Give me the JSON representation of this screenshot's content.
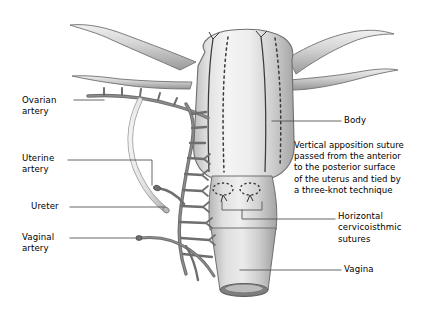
{
  "figure": {
    "background_color": "#ffffff"
  },
  "colors": {
    "organ_light": "#f2f2f2",
    "organ_mid": "#d8d8d8",
    "organ_shadow": "#a8a8a8",
    "organ_outline": "#6f6f6f",
    "vessel_dark": "#777777",
    "vessel_outline": "#5a5a5a",
    "ureter_light": "#cfcfcf",
    "suture_line": "#3a3a3a",
    "leader_line": "#555555",
    "text": "#000000"
  },
  "labels": {
    "left": [
      {
        "id": "ovarian-artery",
        "text": "Ovarian\nartery",
        "x": 22,
        "y": 95
      },
      {
        "id": "uterine-artery",
        "text": "Uterine\nartery",
        "x": 22,
        "y": 153
      },
      {
        "id": "ureter",
        "text": "Ureter",
        "x": 31,
        "y": 202
      },
      {
        "id": "vaginal-artery",
        "text": "Vaginal\nartery",
        "x": 22,
        "y": 233
      }
    ],
    "right": [
      {
        "id": "body",
        "text": "Body",
        "x": 344,
        "y": 116
      },
      {
        "id": "horizontal-cervicoisthmic-sutures",
        "text": "Horizontal\ncervicoisthmic\nsutures",
        "x": 338,
        "y": 211
      },
      {
        "id": "vagina",
        "text": "Vagina",
        "x": 344,
        "y": 266
      }
    ],
    "paragraph": {
      "id": "vertical-apposition-suture-note",
      "text": "Vertical apposition suture\npassed from the anterior\nto the posterior surface\nof the uterus and tied by\na three-knot technique",
      "x": 294,
      "y": 140
    }
  },
  "anatomy": {
    "parts": [
      {
        "name": "fallopian-tube-left",
        "description": "curved tube extending to upper left from the left uterine horn"
      },
      {
        "name": "round-ligament-left",
        "description": "lower curved tube on the left horn"
      },
      {
        "name": "fallopian-tube-right",
        "description": "curved tube extending to upper right from the right uterine horn"
      },
      {
        "name": "round-ligament-right",
        "description": "lower curved tube on the right horn"
      },
      {
        "name": "uterine-fundus-body",
        "description": "large rounded uterine body with vertical shading"
      },
      {
        "name": "cervix",
        "description": "narrowed isthmus below the uterine body"
      },
      {
        "name": "vagina-cuff",
        "description": "cylindrical vaginal cuff with open elliptical rim at the bottom"
      },
      {
        "name": "ovarian-artery-vessel",
        "description": "dark horizontal vessel with short superior branches at upper left"
      },
      {
        "name": "uterine-artery-arcade",
        "description": "dark vessel arcade running vertically along the left uterine border with ladder branches"
      },
      {
        "name": "ureter-tube",
        "description": "pale gray tube curving down and across, cut at its distal end"
      },
      {
        "name": "vaginal-artery-vessel",
        "description": "dark vessel branching inferiorly toward the vagina"
      }
    ],
    "sutures": {
      "vertical_apposition": {
        "count": 2,
        "anterior_style": "solid",
        "posterior_style": "dashed",
        "knots": 2,
        "knot_description": "three-knot tails at the fundus"
      },
      "cervicoisthmic": {
        "count": 2,
        "style": "dashed-oval",
        "description": "two small dashed oval horizontal sutures on the cervix"
      }
    }
  }
}
